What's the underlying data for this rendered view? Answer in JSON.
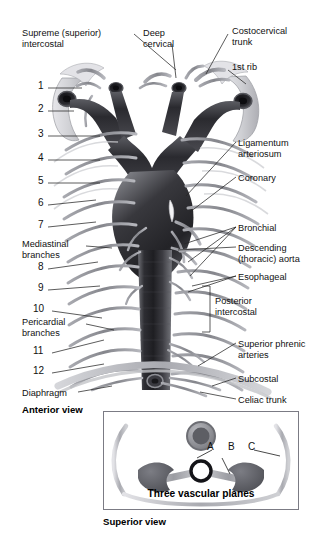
{
  "figure": {
    "background": "#ffffff",
    "ink": "#111111",
    "vessel_dark": "#3b3b40",
    "vessel_mid": "#8f9096",
    "vessel_light": "#c9cace",
    "bone_light": "#dcdce0",
    "leader_color": "#2b2b2b"
  },
  "views": {
    "anterior": "Anterior view",
    "superior": "Superior view"
  },
  "labels_left": [
    {
      "id": "supreme-intercostal",
      "text": "Supreme (superior)\nintercostal",
      "x": 22,
      "y": 28
    },
    {
      "id": "mediastinal-branches",
      "text": "Mediastinal\nbranches",
      "x": 22,
      "y": 239
    },
    {
      "id": "pericardial-branches",
      "text": "Pericardial\nbranches",
      "x": 22,
      "y": 317
    },
    {
      "id": "diaphragm",
      "text": "Diaphragm",
      "x": 22,
      "y": 388
    }
  ],
  "labels_top": [
    {
      "id": "deep-cervical",
      "text": "Deep\ncervical",
      "x": 143,
      "y": 28
    },
    {
      "id": "costocervical-trunk",
      "text": "Costocervical\ntrunk",
      "x": 232,
      "y": 26
    },
    {
      "id": "first-rib",
      "text": "1st rib",
      "x": 232,
      "y": 62
    }
  ],
  "labels_right": [
    {
      "id": "ligamentum-arteriosum",
      "text": "Ligamentum\narteriosum",
      "x": 238,
      "y": 138
    },
    {
      "id": "coronary",
      "text": "Coronary",
      "x": 238,
      "y": 173
    },
    {
      "id": "bronchial",
      "text": "Bronchial",
      "x": 238,
      "y": 223
    },
    {
      "id": "descending-thoracic-aorta",
      "text": "Descending\n(thoracic) aorta",
      "x": 238,
      "y": 243
    },
    {
      "id": "esophageal",
      "text": "Esophageal",
      "x": 238,
      "y": 272
    },
    {
      "id": "posterior-intercostal",
      "text": "Posterior\nintercostal",
      "x": 215,
      "y": 296
    },
    {
      "id": "superior-phrenic-arteries",
      "text": "Superior phrenic\narteries",
      "x": 238,
      "y": 339
    },
    {
      "id": "subcostal",
      "text": "Subcostal",
      "x": 238,
      "y": 374
    },
    {
      "id": "celiac-trunk",
      "text": "Celiac trunk",
      "x": 238,
      "y": 395
    }
  ],
  "rib_numbers": [
    {
      "n": "1",
      "x": 38,
      "y": 86
    },
    {
      "n": "2",
      "x": 38,
      "y": 109
    },
    {
      "n": "3",
      "x": 38,
      "y": 134
    },
    {
      "n": "4",
      "x": 38,
      "y": 158
    },
    {
      "n": "5",
      "x": 38,
      "y": 181
    },
    {
      "n": "6",
      "x": 38,
      "y": 203
    },
    {
      "n": "7",
      "x": 38,
      "y": 225
    },
    {
      "n": "8",
      "x": 38,
      "y": 267
    },
    {
      "n": "9",
      "x": 38,
      "y": 288
    },
    {
      "n": "10",
      "x": 33,
      "y": 309
    },
    {
      "n": "11",
      "x": 33,
      "y": 351
    },
    {
      "n": "12",
      "x": 33,
      "y": 371
    }
  ],
  "inset": {
    "caption": "Three vascular planes",
    "plane_labels": [
      "A",
      "B",
      "C"
    ],
    "box": {
      "x": 103,
      "y": 411,
      "w": 194,
      "h": 97
    }
  }
}
